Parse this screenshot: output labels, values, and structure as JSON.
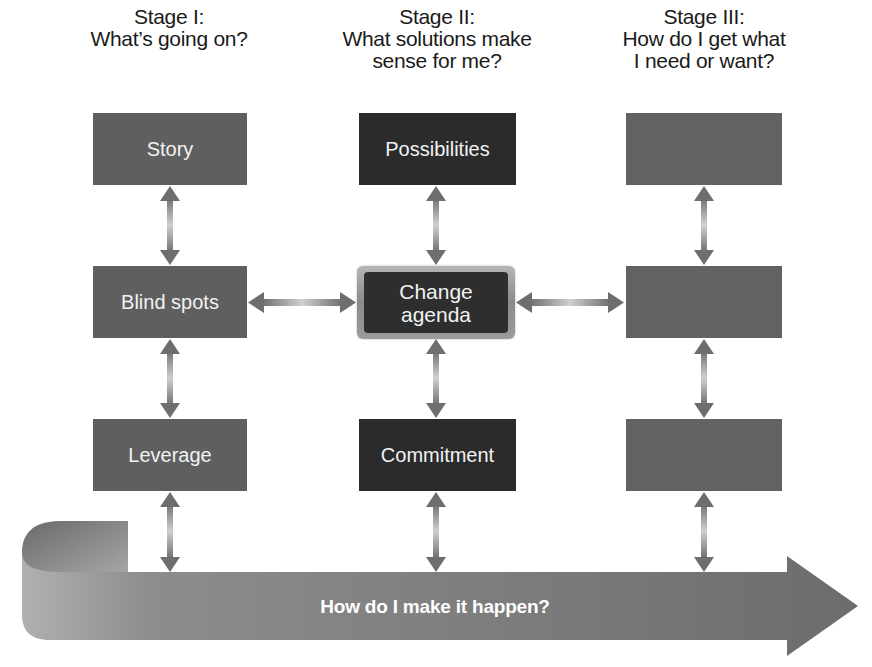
{
  "stages": [
    {
      "title": "Stage I:",
      "question_lines": [
        "What’s going on?"
      ]
    },
    {
      "title": "Stage II:",
      "question_lines": [
        "What solutions make",
        "sense for me?"
      ]
    },
    {
      "title": "Stage III:",
      "question_lines": [
        "How do I get what",
        "I need or want?"
      ]
    }
  ],
  "columns": {
    "stage1": {
      "row1": "Story",
      "row2": "Blind spots",
      "row3": "Leverage"
    },
    "stage2": {
      "row1": "Possibilities",
      "row2_lines": [
        "Change",
        "agenda"
      ],
      "row3": "Commitment"
    },
    "stage3": {
      "row1": "",
      "row2": "",
      "row3": ""
    }
  },
  "flow_arrow": {
    "label": "How do I make it happen?"
  },
  "colors": {
    "box_medium": "#5f5f5f",
    "box_dark": "#2b2b2b",
    "arrow": "#6e6e6e",
    "flow_arrow": "#777777",
    "text_light": "#f2f2f2",
    "header_text": "#1a1a1a"
  }
}
